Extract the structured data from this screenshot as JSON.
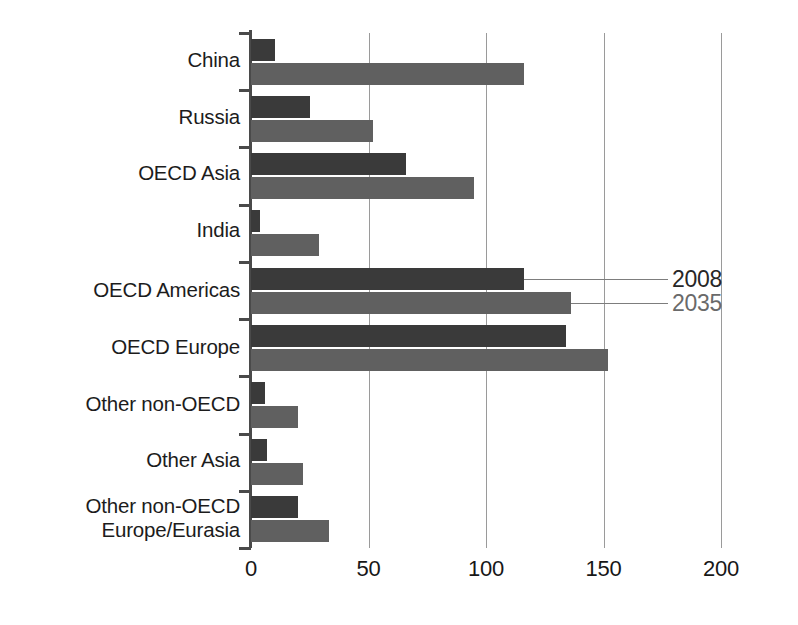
{
  "chart_data": {
    "type": "bar",
    "orientation": "horizontal",
    "title": "",
    "subtitle": "",
    "xlabel": "",
    "ylabel": "",
    "xlim": [
      0,
      200
    ],
    "xticks": [
      0,
      50,
      100,
      150,
      200
    ],
    "xtick_labels": [
      "0",
      "50",
      "100",
      "150",
      "200"
    ],
    "grid": "vertical",
    "legend_position": "inline-callout",
    "categories": [
      "China",
      "Russia",
      "OECD Asia",
      "India",
      "OECD Americas",
      "OECD Europe",
      "Other non-OECD",
      "Other Asia",
      "Other non-OECD\nEurope/Eurasia"
    ],
    "series": [
      {
        "name": "2008",
        "color": "#3a3a3a",
        "values": [
          10,
          25,
          66,
          4,
          116,
          134,
          6,
          7,
          20
        ]
      },
      {
        "name": "2035",
        "color": "#606060",
        "values": [
          116,
          52,
          95,
          29,
          136,
          152,
          20,
          22,
          33
        ]
      }
    ],
    "annotations": [
      {
        "text": "2008",
        "series": "2008",
        "anchor_category": "OECD Americas"
      },
      {
        "text": "2035",
        "series": "2035",
        "anchor_category": "OECD Americas"
      }
    ]
  },
  "colors": {
    "series_2008": "#3a3a3a",
    "series_2035": "#606060",
    "gridline": "#9a9a9a",
    "axis": "#4a4a4a",
    "background": "#ffffff",
    "text": "#1c1c1c",
    "label_2035_text": "#6a6a6a"
  }
}
